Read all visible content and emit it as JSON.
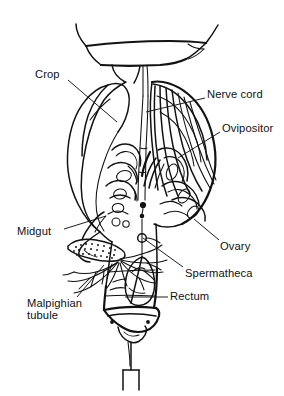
{
  "figure": {
    "domain_kind": "anatomical-line-diagram",
    "background_color": "#ffffff",
    "ink_color": "#121212",
    "width": 284,
    "height": 396
  },
  "labels": [
    {
      "id": "crop",
      "text": "Crop",
      "x": 35,
      "y": 68,
      "align": "left",
      "lines": 1,
      "leader": {
        "from": [
          68,
          80
        ],
        "to": [
          117,
          122
        ]
      }
    },
    {
      "id": "nerve-cord",
      "text": "Nerve cord",
      "x": 207,
      "y": 88,
      "align": "left",
      "lines": 1,
      "leader": {
        "from": [
          205,
          98
        ],
        "to": [
          146,
          112
        ]
      }
    },
    {
      "id": "ovipositor",
      "text": "Ovipositor",
      "x": 222,
      "y": 122,
      "align": "left",
      "lines": 1,
      "leader": {
        "from": [
          220,
          132
        ],
        "to": [
          178,
          158
        ]
      }
    },
    {
      "id": "midgut",
      "text": "Midgut",
      "x": 17,
      "y": 225,
      "align": "left",
      "lines": 1,
      "leader": {
        "from": [
          64,
          229
        ],
        "to": [
          106,
          216
        ]
      }
    },
    {
      "id": "ovary",
      "text": "Ovary",
      "x": 220,
      "y": 240,
      "align": "left",
      "lines": 1,
      "leader": {
        "from": [
          219,
          240
        ],
        "to": [
          194,
          219
        ]
      }
    },
    {
      "id": "spermatheca",
      "text": "Spermatheca",
      "x": 185,
      "y": 267,
      "align": "left",
      "lines": 1,
      "leader": {
        "from": [
          183,
          267
        ],
        "to": [
          143,
          238
        ]
      }
    },
    {
      "id": "rectum",
      "text": "Rectum",
      "x": 170,
      "y": 290,
      "align": "left",
      "lines": 1,
      "leader": {
        "from": [
          168,
          297
        ],
        "to": [
          125,
          297
        ]
      }
    },
    {
      "id": "malpighian-tubule",
      "text": "Malpighian\ntubule",
      "x": 27,
      "y": 297,
      "align": "left",
      "lines": 2,
      "leader": {
        "from": [
          77,
          297
        ],
        "to": [
          104,
          265
        ]
      }
    }
  ],
  "structures": [
    {
      "id": "thorax-cut-rim",
      "name": "thorax cut edge / funnel rim"
    },
    {
      "id": "crop-sac",
      "name": "crop"
    },
    {
      "id": "esophagus-stalk",
      "name": "esophagus stalk"
    },
    {
      "id": "nerve-cord-pair",
      "name": "ventral nerve cord"
    },
    {
      "id": "ovary-mass",
      "name": "ovary with ovarioles"
    },
    {
      "id": "ovipositor-shaft",
      "name": "ovipositor valves"
    },
    {
      "id": "midgut-tube",
      "name": "midgut"
    },
    {
      "id": "pylorus-stipple",
      "name": "pyloric region (stippled)"
    },
    {
      "id": "malpighian-tubules",
      "name": "malpighian tubules"
    },
    {
      "id": "spermatheca-sac",
      "name": "spermatheca"
    },
    {
      "id": "rectum-sac",
      "name": "rectum"
    },
    {
      "id": "sting-plate",
      "name": "sting base plate"
    },
    {
      "id": "sting-needle",
      "name": "sting / shaft"
    },
    {
      "id": "sting-tip-box",
      "name": "sting tip detail box"
    }
  ]
}
